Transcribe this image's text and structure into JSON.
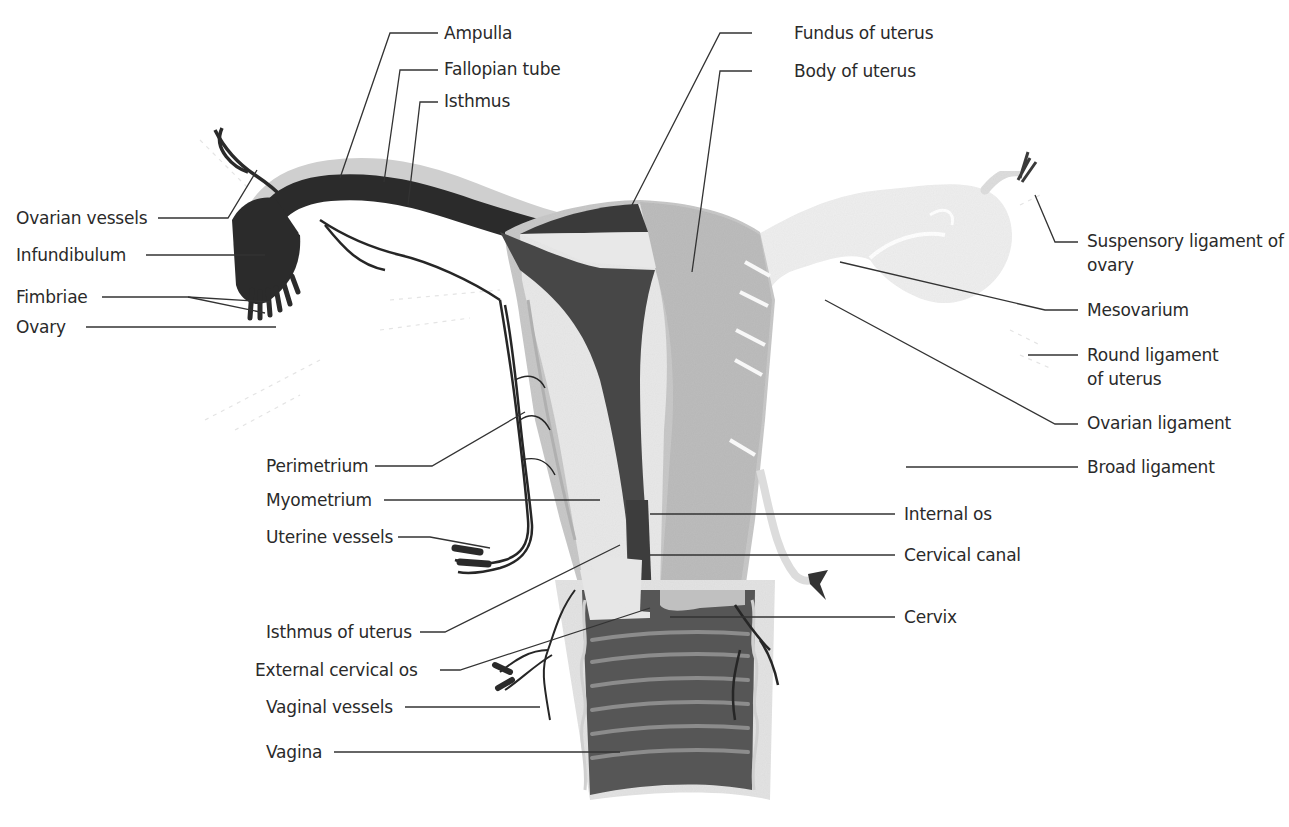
{
  "diagram": {
    "colors": {
      "background": "#ffffff",
      "label_text": "#2a2a2a",
      "leader_line": "#333333",
      "tube_lumen": "#2b2b2b",
      "cavity": "#4a4a4a",
      "myometrium": "#e6e6e6",
      "perimetrium_surface": "#c4c4c4",
      "broad_ligament": "#f1f1f1",
      "vessels": "#262626",
      "vagina_wall": "#555555",
      "vagina_rugae": "#8a8a8a"
    },
    "labels_left": [
      {
        "id": "ovarian-vessels",
        "text": "Ovarian vessels"
      },
      {
        "id": "infundibulum",
        "text": "Infundibulum"
      },
      {
        "id": "fimbriae",
        "text": "Fimbriae"
      },
      {
        "id": "ovary",
        "text": "Ovary"
      },
      {
        "id": "perimetrium",
        "text": "Perimetrium"
      },
      {
        "id": "myometrium",
        "text": "Myometrium"
      },
      {
        "id": "uterine-vessels",
        "text": "Uterine vessels"
      },
      {
        "id": "isthmus-of-uterus",
        "text": "Isthmus of uterus"
      },
      {
        "id": "external-cervical-os",
        "text": "External cervical os"
      },
      {
        "id": "vaginal-vessels",
        "text": "Vaginal vessels"
      },
      {
        "id": "vagina",
        "text": "Vagina"
      }
    ],
    "labels_top": [
      {
        "id": "ampulla",
        "text": "Ampulla"
      },
      {
        "id": "fallopian-tube",
        "text": "Fallopian tube"
      },
      {
        "id": "isthmus",
        "text": "Isthmus"
      },
      {
        "id": "fundus-of-uterus",
        "text": "Fundus of uterus"
      },
      {
        "id": "body-of-uterus",
        "text": "Body of uterus"
      }
    ],
    "labels_right": [
      {
        "id": "suspensory-ligament",
        "text": "Suspensory ligament of ovary"
      },
      {
        "id": "mesovarium",
        "text": "Mesovarium"
      },
      {
        "id": "round-ligament",
        "text": "Round ligament of uterus"
      },
      {
        "id": "ovarian-ligament",
        "text": "Ovarian ligament"
      },
      {
        "id": "broad-ligament",
        "text": "Broad ligament"
      },
      {
        "id": "internal-os",
        "text": "Internal os"
      },
      {
        "id": "cervical-canal",
        "text": "Cervical canal"
      },
      {
        "id": "cervix",
        "text": "Cervix"
      }
    ]
  }
}
